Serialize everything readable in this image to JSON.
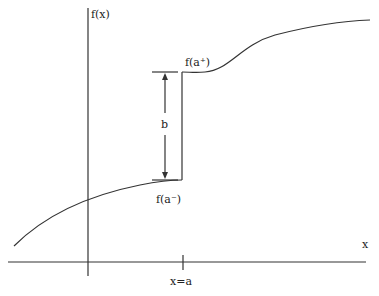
{
  "diagram": {
    "labels": {
      "y_axis": "f(x)",
      "x_axis": "x",
      "right_limit": "f(a⁺)",
      "left_limit": "f(a⁻)",
      "jump": "b",
      "tick": "x=a"
    },
    "colors": {
      "line": "#333333",
      "background": "#ffffff"
    }
  }
}
